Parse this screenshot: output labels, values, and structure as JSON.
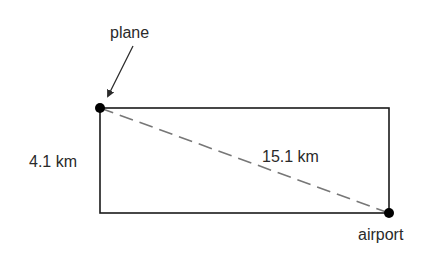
{
  "diagram": {
    "labels": {
      "plane": "plane",
      "airport": "airport",
      "height": "4.1 km",
      "diagonal": "15.1 km"
    },
    "colors": {
      "line": "#1a1a1a",
      "dashed": "#777777",
      "dot": "#000000",
      "text": "#2a2a2a"
    }
  }
}
